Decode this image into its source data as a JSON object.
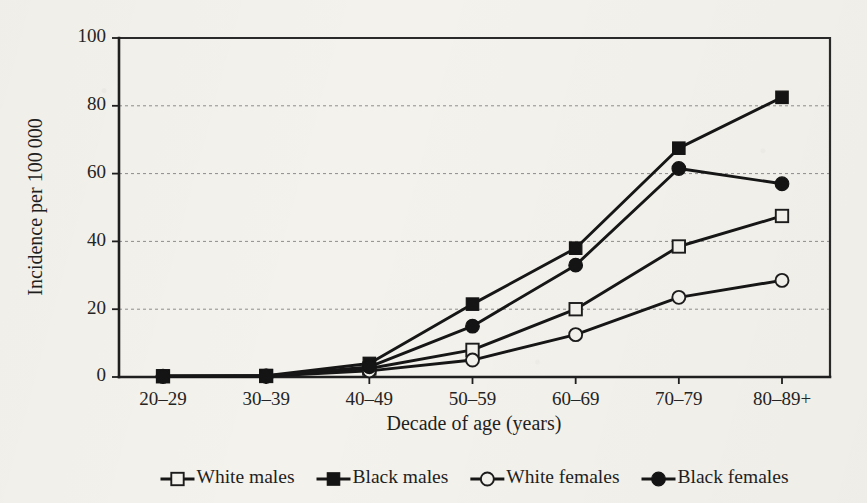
{
  "figure": {
    "background_color": "#f4f2ec",
    "ink_color": "#161616"
  },
  "chart_data": {
    "type": "line",
    "title": "",
    "xlabel": "Decade of age (years)",
    "ylabel": "Incidence per 100 000",
    "categories": [
      "20–29",
      "30–39",
      "40–49",
      "50–59",
      "60–69",
      "70–79",
      "80–89+"
    ],
    "ylim": [
      0,
      100
    ],
    "yticks": [
      0,
      20,
      40,
      60,
      80,
      100
    ],
    "ytick_labels": [
      "0",
      "20",
      "40",
      "60",
      "80",
      "100"
    ],
    "grid": "horizontal-dotted",
    "legend_position": "below-axis",
    "series": [
      {
        "name": "White males",
        "marker": "open-square",
        "values": [
          0.2,
          0.3,
          2.5,
          8.0,
          20.0,
          38.5,
          47.5
        ]
      },
      {
        "name": "Black males",
        "marker": "filled-square",
        "values": [
          0.3,
          0.4,
          4.0,
          21.5,
          38.0,
          67.5,
          82.5
        ]
      },
      {
        "name": "White females",
        "marker": "open-circle",
        "values": [
          0.2,
          0.2,
          1.8,
          5.0,
          12.5,
          23.5,
          28.5
        ]
      },
      {
        "name": "Black females",
        "marker": "filled-circle",
        "values": [
          0.2,
          0.3,
          3.0,
          15.0,
          33.0,
          61.5,
          57.0
        ]
      }
    ]
  },
  "legend": {
    "items": [
      {
        "label": "White males",
        "marker": "open-square"
      },
      {
        "label": "Black males",
        "marker": "filled-square"
      },
      {
        "label": "White females",
        "marker": "open-circle"
      },
      {
        "label": "Black females",
        "marker": "filled-circle"
      }
    ]
  }
}
